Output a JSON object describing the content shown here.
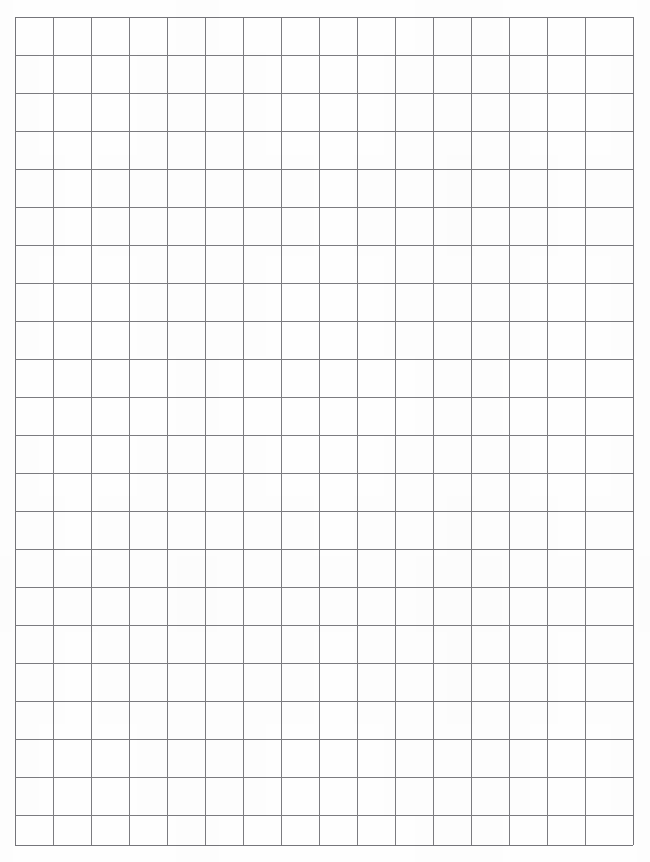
{
  "document": {
    "title": "Blank Graph Paper Grid",
    "page_width": 650,
    "page_height": 862,
    "background_color": "#fefefe",
    "content_type": "grid",
    "visible_text": ""
  },
  "grid": {
    "name": "graph-paper-grid",
    "origin_x": 15,
    "origin_y": 17,
    "right_edge_x": 633,
    "bottom_edge_y": 845,
    "columns": 16,
    "rows": 22,
    "cell_width": 38,
    "cell_height": 38,
    "last_column_width": 33,
    "last_row_height": 37,
    "line_color": "#7c7c80",
    "border_color": "#75757a",
    "line_width": 1,
    "cell_fill": "#ffffff",
    "column_x_positions": [
      15,
      53,
      91,
      129,
      167,
      205,
      243,
      281,
      319,
      357,
      395,
      433,
      471,
      509,
      547,
      585,
      633
    ],
    "row_y_positions": [
      17,
      55,
      93,
      131,
      169,
      207,
      245,
      283,
      321,
      359,
      397,
      435,
      473,
      511,
      549,
      587,
      625,
      663,
      701,
      739,
      777,
      815,
      845
    ]
  },
  "margins": {
    "left": 15,
    "top": 17,
    "right": 17,
    "bottom": 17
  }
}
